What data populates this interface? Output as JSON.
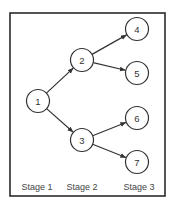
{
  "diagram": {
    "type": "tree",
    "frame": {
      "x": 10,
      "y": 13,
      "width": 155,
      "height": 183
    },
    "colors": {
      "stroke": "#333333",
      "frame": "#2b2b2b",
      "text": "#333333",
      "stage_text": "#444444",
      "background": "#ffffff"
    },
    "node_radius": 11.5,
    "nodes": [
      {
        "id": "1",
        "label": "1",
        "x": 38,
        "y": 101,
        "stage": 1
      },
      {
        "id": "2",
        "label": "2",
        "x": 82,
        "y": 60,
        "stage": 2
      },
      {
        "id": "3",
        "label": "3",
        "x": 82,
        "y": 140,
        "stage": 2
      },
      {
        "id": "4",
        "label": "4",
        "x": 137,
        "y": 29,
        "stage": 3
      },
      {
        "id": "5",
        "label": "5",
        "x": 137,
        "y": 73,
        "stage": 3
      },
      {
        "id": "6",
        "label": "6",
        "x": 137,
        "y": 118,
        "stage": 3
      },
      {
        "id": "7",
        "label": "7",
        "x": 137,
        "y": 162,
        "stage": 3
      }
    ],
    "edges": [
      {
        "from": "1",
        "to": "2"
      },
      {
        "from": "1",
        "to": "3"
      },
      {
        "from": "2",
        "to": "4"
      },
      {
        "from": "2",
        "to": "5"
      },
      {
        "from": "3",
        "to": "6"
      },
      {
        "from": "3",
        "to": "7"
      }
    ],
    "stages": [
      {
        "label": "Stage 1",
        "x": 37,
        "y": 187
      },
      {
        "label": "Stage 2",
        "x": 82,
        "y": 187
      },
      {
        "label": "Stage 3",
        "x": 139,
        "y": 187
      }
    ]
  }
}
